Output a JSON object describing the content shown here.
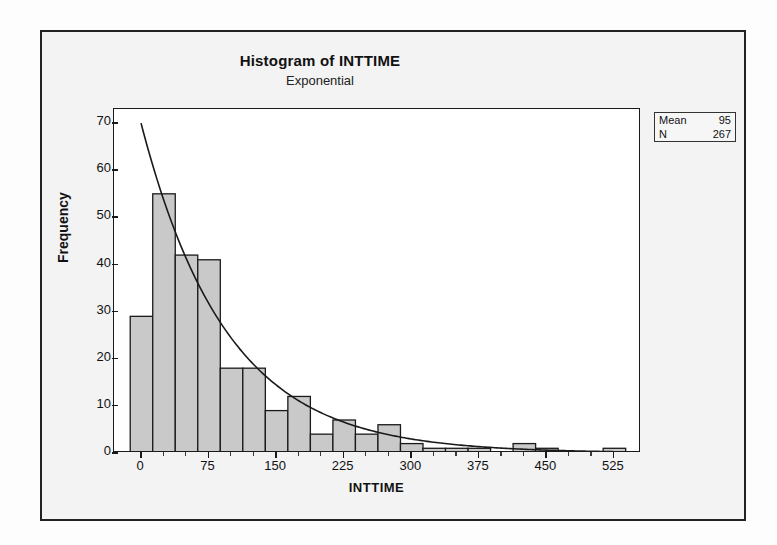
{
  "window": {
    "background_color": "#fdfdfd",
    "frame_color": "#222222"
  },
  "chart_data": {
    "type": "bar",
    "title": "Histogram of INTTIME",
    "subtitle": "Exponential",
    "xlabel": "INTTIME",
    "ylabel": "Frequency",
    "xlim": [
      -30,
      555
    ],
    "ylim": [
      0,
      73
    ],
    "grid": false,
    "bar_fill_color": "#c9c9c9",
    "bar_edge_color": "#1a1a1a",
    "curve_color": "#1a1a1a",
    "bin_width": 25,
    "bin_starts": [
      -12,
      13,
      38,
      63,
      88,
      113,
      138,
      163,
      188,
      213,
      238,
      263,
      288,
      313,
      338,
      363,
      388,
      413,
      438,
      463,
      488,
      513
    ],
    "categories": [
      "0",
      "25",
      "50",
      "75",
      "100",
      "125",
      "150",
      "175",
      "200",
      "225",
      "250",
      "275",
      "300",
      "325",
      "350",
      "375",
      "400",
      "425",
      "450",
      "475",
      "500",
      "525"
    ],
    "values": [
      29,
      55,
      42,
      41,
      18,
      18,
      9,
      12,
      4,
      7,
      4,
      6,
      2,
      1,
      1,
      1,
      0,
      2,
      1,
      0,
      0,
      1
    ],
    "yticks": [
      0,
      10,
      20,
      30,
      40,
      50,
      60,
      70
    ],
    "xticks": [
      0,
      75,
      150,
      225,
      300,
      375,
      450,
      525
    ],
    "x_minor_ticks": [
      25,
      50,
      100,
      125,
      175,
      200,
      250,
      275,
      325,
      350,
      400,
      425,
      475,
      500
    ],
    "fit_curve": {
      "name": "Exponential",
      "mean": 95,
      "scale_peak": 70,
      "x_start": 0,
      "x_end": 550
    },
    "legend": {
      "position": "top-right-outside",
      "rows": [
        {
          "label": "Mean",
          "value": "95"
        },
        {
          "label": "N",
          "value": "267"
        }
      ]
    }
  }
}
